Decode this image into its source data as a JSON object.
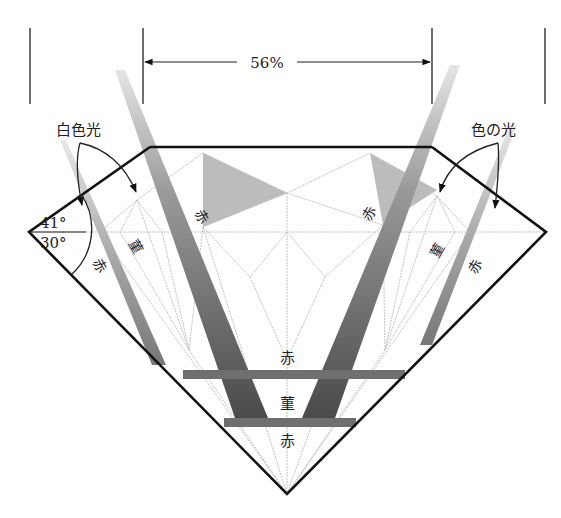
{
  "diagram": {
    "table_width_label": "56%",
    "labels": {
      "white_light": "白色光",
      "colored_light": "色の光",
      "crown_angle_upper": "41°",
      "crown_angle_lower": "30°"
    },
    "color_labels": {
      "red": "赤",
      "violet": "菫"
    },
    "center_labels": [
      "赤",
      "菫",
      "赤"
    ],
    "colors": {
      "outline": "#111111",
      "facet_lines": "#bdbdbd",
      "beam_dark": "#555555",
      "beam_mid": "#8a8a8a",
      "beam_light": "#c4c4c4",
      "facet_shade": "#b8b8b8"
    }
  }
}
